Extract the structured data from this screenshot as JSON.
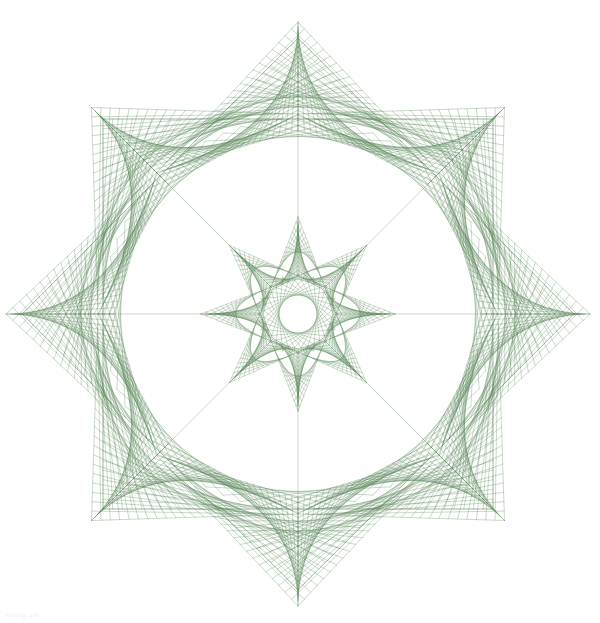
{
  "canvas": {
    "width": 600,
    "height": 623,
    "background": "#ffffff"
  },
  "style": {
    "stroke": "#4f7f4f",
    "stroke_opacity": 0.55,
    "stroke_width": 0.55
  },
  "geometry": {
    "center": [
      298,
      314
    ],
    "symmetry": 8,
    "outer_spike_radius": 292,
    "square_half_side": 195,
    "mid_ring_radius": 195,
    "inner_star_radius": 97,
    "inner_ring_radius": 40
  },
  "layers": [
    {
      "name": "outer-spikes",
      "type": "spike",
      "tip_r": 292,
      "base_r": 200,
      "half_angle_deg": 22.5,
      "threads": 22
    },
    {
      "name": "square-frames",
      "type": "squares",
      "half_side": 195,
      "rotations_deg": [
        0,
        45
      ],
      "threads": 20
    },
    {
      "name": "mid-envelope",
      "type": "chords",
      "r": 196,
      "skip": 9,
      "points": 64
    },
    {
      "name": "inner-star",
      "type": "spike",
      "tip_r": 97,
      "base_r": 38,
      "half_angle_deg": 22.5,
      "threads": 14
    },
    {
      "name": "inner-ring",
      "type": "chords",
      "r": 40,
      "skip": 11,
      "points": 32
    }
  ],
  "caption": "string art"
}
